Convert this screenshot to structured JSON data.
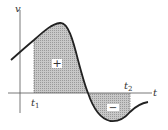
{
  "diagram": {
    "axes": {
      "x_label": "t",
      "y_label": "v"
    },
    "markers": [
      {
        "label": "t",
        "sub": "1"
      },
      {
        "label": "t",
        "sub": "2"
      }
    ],
    "regions": [
      {
        "sign": "+",
        "meaning": "positive area"
      },
      {
        "sign": "−",
        "meaning": "negative area"
      }
    ],
    "colors": {
      "curve": "#222222",
      "fill": "#b8b8b8",
      "axis": "#555555"
    }
  }
}
